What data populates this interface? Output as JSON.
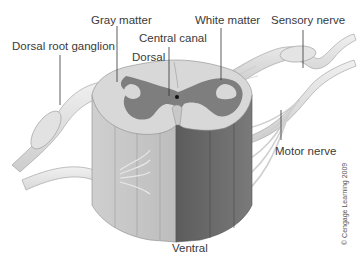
{
  "labels": {
    "gray_matter": "Gray matter",
    "white_matter": "White matter",
    "sensory_nerve": "Sensory nerve",
    "dorsal_root_ganglion": "Dorsal root ganglion",
    "central_canal": "Central canal",
    "dorsal": "Dorsal",
    "motor_nerve": "Motor nerve",
    "ventral": "Ventral"
  },
  "copyright": "© Cengage Learning 2009",
  "colors": {
    "white_matter_light": "#d6d6d6",
    "white_matter_dark": "#6e6e6e",
    "gray_matter": "#7d7d7d",
    "nerve": "#e4e4e4",
    "central_canal": "#111111",
    "leader_line": "#333333"
  }
}
